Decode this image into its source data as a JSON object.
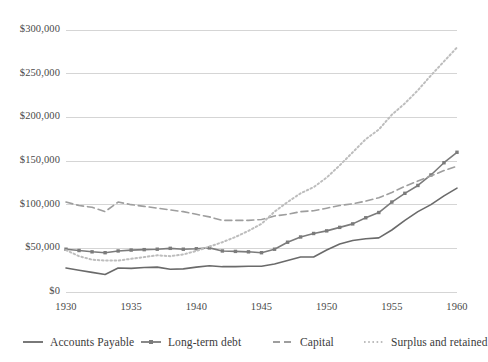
{
  "chart_data": {
    "type": "line",
    "title": "",
    "subtitle": "",
    "xlabel": "",
    "ylabel": "",
    "xlim": [
      1930,
      1960
    ],
    "ylim": [
      0,
      300000
    ],
    "grid": "horizontal",
    "legend_position": "bottom",
    "x": [
      1930,
      1931,
      1932,
      1933,
      1934,
      1935,
      1936,
      1937,
      1938,
      1939,
      1940,
      1941,
      1942,
      1943,
      1944,
      1945,
      1946,
      1947,
      1948,
      1949,
      1950,
      1951,
      1952,
      1953,
      1954,
      1955,
      1956,
      1957,
      1958,
      1959,
      1960
    ],
    "xticks": [
      1930,
      1935,
      1940,
      1945,
      1950,
      1955,
      1960
    ],
    "xtick_labels": [
      "1930",
      "1935",
      "1940",
      "1945",
      "1950",
      "1955",
      "1960"
    ],
    "yticks": [
      0,
      50000,
      100000,
      150000,
      200000,
      250000,
      300000
    ],
    "ytick_labels": [
      "$0",
      "$50,000",
      "$100,000",
      "$150,000",
      "$200,000",
      "$250,000",
      "$300,000"
    ],
    "series": [
      {
        "name": "Accounts Payable",
        "style": "solid",
        "marker": "none",
        "color": "#6a6a6a",
        "values": [
          27500,
          25000,
          22500,
          20000,
          27500,
          27000,
          28000,
          28500,
          26000,
          26500,
          28500,
          30000,
          29000,
          29000,
          29500,
          29500,
          32000,
          36000,
          40000,
          40000,
          48000,
          55000,
          59000,
          61000,
          62000,
          71000,
          82000,
          92000,
          100000,
          110000,
          119000
        ]
      },
      {
        "name": "Long-term debt",
        "style": "solid",
        "marker": "square",
        "color": "#7b7b7b",
        "values": [
          49000,
          47500,
          46000,
          45000,
          47000,
          48000,
          48500,
          49000,
          50000,
          49000,
          49500,
          50500,
          47000,
          46500,
          46000,
          45000,
          49000,
          57000,
          63000,
          67000,
          70000,
          74000,
          78000,
          85000,
          91000,
          103000,
          113000,
          122000,
          134000,
          148000,
          160000
        ]
      },
      {
        "name": "Capital",
        "style": "dashed",
        "marker": "none",
        "color": "#9e9e9e",
        "values": [
          103000,
          99000,
          97000,
          92000,
          103000,
          100000,
          98000,
          96000,
          94000,
          92000,
          89000,
          86000,
          82000,
          82000,
          82000,
          83000,
          87000,
          89000,
          92000,
          93000,
          96000,
          99000,
          101000,
          104000,
          108000,
          114000,
          121000,
          127000,
          133000,
          139000,
          144000
        ]
      },
      {
        "name": "Surplus and retained",
        "style": "dotted",
        "marker": "none",
        "color": "#bdbdbd",
        "values": [
          48000,
          41000,
          37000,
          36000,
          36000,
          38000,
          40000,
          42000,
          41000,
          43000,
          47000,
          52000,
          57000,
          63000,
          70000,
          78000,
          92000,
          103000,
          113000,
          120000,
          131000,
          145000,
          160000,
          175000,
          186000,
          203000,
          216000,
          231000,
          248000,
          264000,
          280000
        ]
      }
    ]
  },
  "axis": {
    "ytick_labels": [
      "$300,000",
      "$250,000",
      "$200,000",
      "$150,000",
      "$100,000",
      "$50,000",
      "$0"
    ],
    "xtick_labels": [
      "1930",
      "1935",
      "1940",
      "1945",
      "1950",
      "1955",
      "1960"
    ]
  },
  "legend": {
    "items": [
      {
        "label": "Accounts Payable",
        "style": "solid",
        "marker": "none",
        "color": "#6a6a6a"
      },
      {
        "label": "Long-term debt",
        "style": "solid",
        "marker": "square",
        "color": "#7b7b7b"
      },
      {
        "label": "Capital",
        "style": "dashed",
        "marker": "none",
        "color": "#9e9e9e"
      },
      {
        "label": "Surplus and retained",
        "style": "dotted",
        "marker": "none",
        "color": "#bdbdbd"
      }
    ]
  },
  "colors": {
    "grid": "#d5d5d5",
    "text": "#3f3f3f",
    "background": "#ffffff"
  }
}
